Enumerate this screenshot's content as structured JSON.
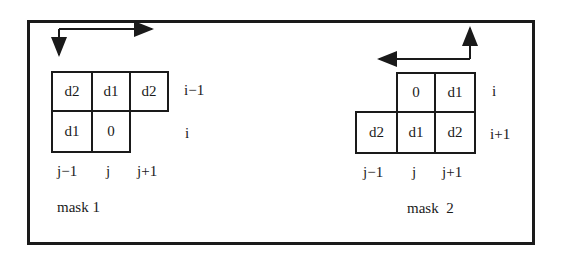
{
  "diagram": {
    "mask1": {
      "title": "mask 1",
      "cells": [
        {
          "row": "i-1",
          "col": "j-1",
          "value": "d2"
        },
        {
          "row": "i-1",
          "col": "j",
          "value": "d1"
        },
        {
          "row": "i-1",
          "col": "j+1",
          "value": "d2"
        },
        {
          "row": "i",
          "col": "j-1",
          "value": "d1"
        },
        {
          "row": "i",
          "col": "j",
          "value": "0"
        }
      ],
      "row_labels": [
        "i−1",
        "i"
      ],
      "col_labels": [
        "j−1",
        "j",
        "j+1"
      ],
      "scan_direction": "left-to-right, top-to-bottom"
    },
    "mask2": {
      "title": "mask  2",
      "cells": [
        {
          "row": "i",
          "col": "j",
          "value": "0"
        },
        {
          "row": "i",
          "col": "j+1",
          "value": "d1"
        },
        {
          "row": "i+1",
          "col": "j-1",
          "value": "d2"
        },
        {
          "row": "i+1",
          "col": "j",
          "value": "d1"
        },
        {
          "row": "i+1",
          "col": "j+1",
          "value": "d2"
        }
      ],
      "row_labels": [
        "i",
        "i+1"
      ],
      "col_labels": [
        "j−1",
        "j",
        "j+1"
      ],
      "scan_direction": "right-to-left, bottom-to-top"
    }
  }
}
